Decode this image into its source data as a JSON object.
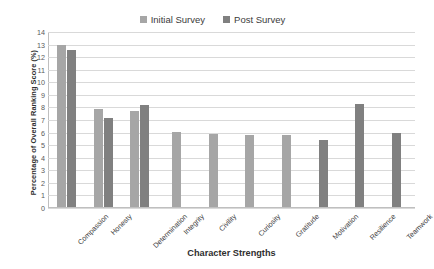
{
  "chart_data": {
    "type": "bar",
    "title": "",
    "xlabel": "Character Strengths",
    "ylabel": "Percentage of Overall Ranking Score (%)",
    "categories": [
      "Compassion",
      "Honesty",
      "Determination",
      "Integrity",
      "Civility",
      "Curiosity",
      "Gratitude",
      "Motivation",
      "Resilience",
      "Teamwork"
    ],
    "series": [
      {
        "name": "Initial Survey",
        "color": "#a6a6a6",
        "values": [
          12.9,
          7.8,
          7.6,
          6.0,
          5.8,
          5.75,
          5.7,
          null,
          null,
          null
        ]
      },
      {
        "name": "Post Survey",
        "color": "#808080",
        "values": [
          12.5,
          7.1,
          8.1,
          null,
          null,
          null,
          null,
          5.3,
          8.2,
          5.9
        ]
      }
    ],
    "ylim": [
      0,
      14
    ],
    "ytick_step": 1,
    "yticks": [
      "14",
      "13",
      "12",
      "11",
      "10",
      "9",
      "8",
      "7",
      "6",
      "5",
      "4",
      "3",
      "2",
      "1",
      "0"
    ],
    "grid": true,
    "legend_position": "top-center"
  }
}
